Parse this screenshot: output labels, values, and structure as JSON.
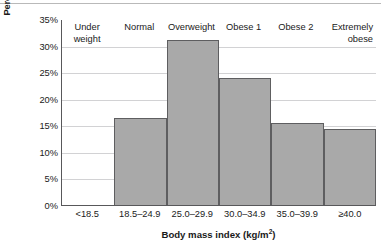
{
  "chart_data": {
    "type": "bar",
    "title": "",
    "xlabel": "Body mass index (kg/m2)",
    "xlabel_base": "Body mass index (kg/m",
    "xlabel_exponent": "2",
    "xlabel_suffix": ")",
    "ylabel": "Percentage of population",
    "categories": [
      "<18.5",
      "18.5–24.9",
      "25.0–29.9",
      "30.0–34.9",
      "35.0–39.9",
      "≥40.0"
    ],
    "category_names": [
      "Under weight",
      "Normal",
      "Overweight",
      "Obese 1",
      "Obese 2",
      "Extremely obese"
    ],
    "category_names_lines": [
      [
        "Under",
        "weight"
      ],
      [
        "Normal"
      ],
      [
        "Overweight"
      ],
      [
        "Obese 1"
      ],
      [
        "Obese 2"
      ],
      [
        "Extremely",
        "obese"
      ]
    ],
    "values": [
      0,
      16.3,
      31.0,
      23.9,
      15.4,
      14.3
    ],
    "ylim": [
      0,
      35
    ],
    "ytick_values": [
      0,
      5,
      10,
      15,
      20,
      25,
      30,
      35
    ],
    "ytick_labels": [
      "0%",
      "5%",
      "10%",
      "15%",
      "20%",
      "25%",
      "30%",
      "35%"
    ],
    "grid": true,
    "grid_axis": "y",
    "legend": false,
    "legend_position": "none",
    "bar_fill_color": "#a9a9a9",
    "bar_edge_color": "#5e5e60",
    "axis_color": "#58585a",
    "gridline_color": "#d2d2d4",
    "text_color": "#1a1a1a",
    "background_color": "#ffffff"
  }
}
